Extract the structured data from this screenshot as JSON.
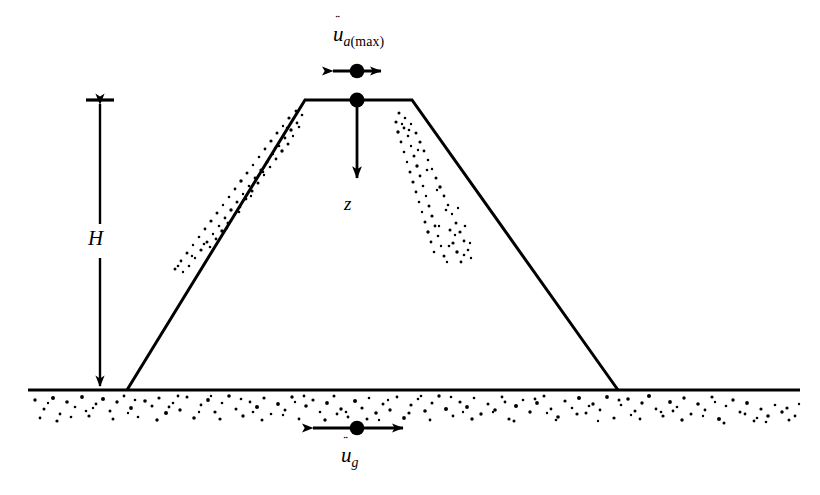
{
  "figure": {
    "name": "embankment-seismic-response-diagram",
    "colors": {
      "ink": "#000000",
      "background": "#ffffff"
    }
  },
  "labels": {
    "crest_acceleration": {
      "symbol": "u",
      "accent": "¨",
      "subscript_italic": "a",
      "subscript_upright": "(max)",
      "full_text": "ü a(max)"
    },
    "ground_acceleration": {
      "symbol": "u",
      "accent": "¨",
      "subscript_italic": "g",
      "subscript_upright": "",
      "full_text": "ü g"
    },
    "height": {
      "symbol": "H",
      "full_text": "H"
    },
    "depth": {
      "symbol": "z",
      "full_text": "z"
    }
  },
  "geometry": {
    "canvas": {
      "width": 820,
      "height": 495
    },
    "ground_line": {
      "x1": 28,
      "x2": 800,
      "y": 390,
      "thickness": 3.2
    },
    "embankment": {
      "left_toe": {
        "x": 127,
        "y": 390
      },
      "left_crest": {
        "x": 305,
        "y": 100
      },
      "right_crest": {
        "x": 412,
        "y": 100
      },
      "right_toe": {
        "x": 618,
        "y": 390
      },
      "crest_width": 107,
      "height": 290
    },
    "crest_node": {
      "x": 357,
      "y": 100,
      "radius": 7.5
    },
    "ground_node": {
      "x": 357,
      "y": 428,
      "radius": 7.5
    },
    "crest_arrow": {
      "x1": 320,
      "x2": 394,
      "y": 71,
      "style": "double-headed-horizontal"
    },
    "ground_arrow": {
      "x1": 300,
      "x2": 416,
      "y": 428,
      "style": "double-headed-horizontal"
    },
    "depth_arrow": {
      "x": 357,
      "y1": 100,
      "y2": 191,
      "style": "single-headed-down"
    },
    "height_arrow": {
      "x": 100,
      "y_top": 100,
      "y_bottom": 390,
      "gap_top": 222,
      "gap_bottom": 258,
      "style": "double-headed-vertical-with-label-gap"
    },
    "foundation_stipple": {
      "y_top": 394,
      "y_bottom": 424,
      "density": "high"
    },
    "slope_stipple": {
      "band": "parallel-to-upper-slopes",
      "density": "sparse"
    }
  }
}
